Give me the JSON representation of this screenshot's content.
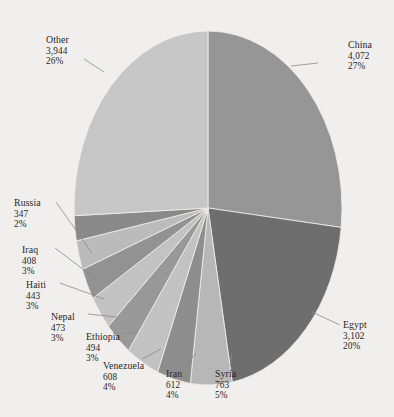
{
  "chart_data": {
    "type": "pie",
    "title": "",
    "subtitle": "",
    "xlabel": "",
    "ylabel": "",
    "legend_position": "none",
    "grid": false,
    "total": 15228,
    "categories": [
      "China",
      "Egypt",
      "Syria",
      "Iran",
      "Venezuela",
      "Ethiopia",
      "Nepal",
      "Haiti",
      "Iraq",
      "Russia",
      "Other"
    ],
    "values": [
      4072,
      3102,
      763,
      612,
      608,
      494,
      473,
      443,
      408,
      347,
      3944
    ],
    "percents": [
      27,
      20,
      5,
      4,
      4,
      3,
      3,
      3,
      3,
      2,
      26
    ],
    "slices": [
      {
        "name": "China",
        "value": "4,072",
        "percent": "27%",
        "color": "#979797",
        "start_deg": 0,
        "end_deg": 96.3,
        "label_x": 348,
        "label_y": 40,
        "align": "left",
        "leader": [
          [
            318,
            63
          ],
          [
            291,
            66
          ]
        ]
      },
      {
        "name": "Egypt",
        "value": "3,102",
        "percent": "20%",
        "color": "#6f6f6f",
        "start_deg": 96.3,
        "end_deg": 169.6,
        "label_x": 343,
        "label_y": 320,
        "align": "left",
        "leader": [
          [
            340,
            325
          ],
          [
            312,
            312
          ]
        ]
      },
      {
        "name": "Syria",
        "value": "763",
        "percent": "5%",
        "color": "#b9b9b9",
        "start_deg": 169.6,
        "end_deg": 187.6,
        "label_x": 215,
        "label_y": 369,
        "align": "left",
        "leader": [
          [
            230,
            366
          ],
          [
            232,
            352
          ]
        ]
      },
      {
        "name": "Iran",
        "value": "612",
        "percent": "4%",
        "color": "#8f8f8f",
        "start_deg": 187.6,
        "end_deg": 202.1,
        "label_x": 166,
        "label_y": 369,
        "align": "left",
        "leader": [
          [
            186,
            366
          ],
          [
            196,
            353
          ]
        ]
      },
      {
        "name": "Venezuela",
        "value": "608",
        "percent": "4%",
        "color": "#c4c4c4",
        "start_deg": 202.1,
        "end_deg": 216.4,
        "label_x": 103,
        "label_y": 361,
        "align": "left",
        "leader": [
          [
            142,
            359
          ],
          [
            161,
            349
          ]
        ]
      },
      {
        "name": "Ethiopia",
        "value": "494",
        "percent": "3%",
        "color": "#9a9a9a",
        "start_deg": 216.4,
        "end_deg": 228.1,
        "label_x": 86,
        "label_y": 332,
        "align": "left",
        "leader": [
          [
            124,
            334
          ],
          [
            138,
            332
          ]
        ]
      },
      {
        "name": "Nepal",
        "value": "473",
        "percent": "3%",
        "color": "#c4c4c4",
        "start_deg": 228.1,
        "end_deg": 239.3,
        "label_x": 51,
        "label_y": 312,
        "align": "left",
        "leader": [
          [
            88,
            314
          ],
          [
            117,
            317
          ]
        ]
      },
      {
        "name": "Haiti",
        "value": "443",
        "percent": "3%",
        "color": "#949494",
        "start_deg": 239.3,
        "end_deg": 249.7,
        "label_x": 26,
        "label_y": 280,
        "align": "left",
        "leader": [
          [
            60,
            283
          ],
          [
            104,
            299
          ]
        ]
      },
      {
        "name": "Iraq",
        "value": "408",
        "percent": "3%",
        "color": "#bdbdbd",
        "start_deg": 249.7,
        "end_deg": 259.3,
        "label_x": 22,
        "label_y": 245,
        "align": "left",
        "leader": [
          [
            55,
            248
          ],
          [
            96,
            279
          ]
        ]
      },
      {
        "name": "Russia",
        "value": "347",
        "percent": "2%",
        "color": "#8b8b8b",
        "start_deg": 259.3,
        "end_deg": 267.5,
        "label_x": 14,
        "label_y": 198,
        "align": "left",
        "leader": [
          [
            56,
            202
          ],
          [
            92,
            253
          ]
        ]
      },
      {
        "name": "Other",
        "value": "3,944",
        "percent": "26%",
        "color": "#c8c8c8",
        "start_deg": 267.5,
        "end_deg": 360,
        "label_x": 46,
        "label_y": 35,
        "align": "left",
        "leader": [
          [
            84,
            59
          ],
          [
            104,
            72
          ]
        ]
      }
    ],
    "geometry": {
      "cx": 208,
      "cy": 208,
      "rx": 134,
      "ry": 177
    },
    "colors": {
      "background": "#f2f1ef",
      "text": "#2a2724",
      "leader": "#8b8b8b"
    }
  }
}
